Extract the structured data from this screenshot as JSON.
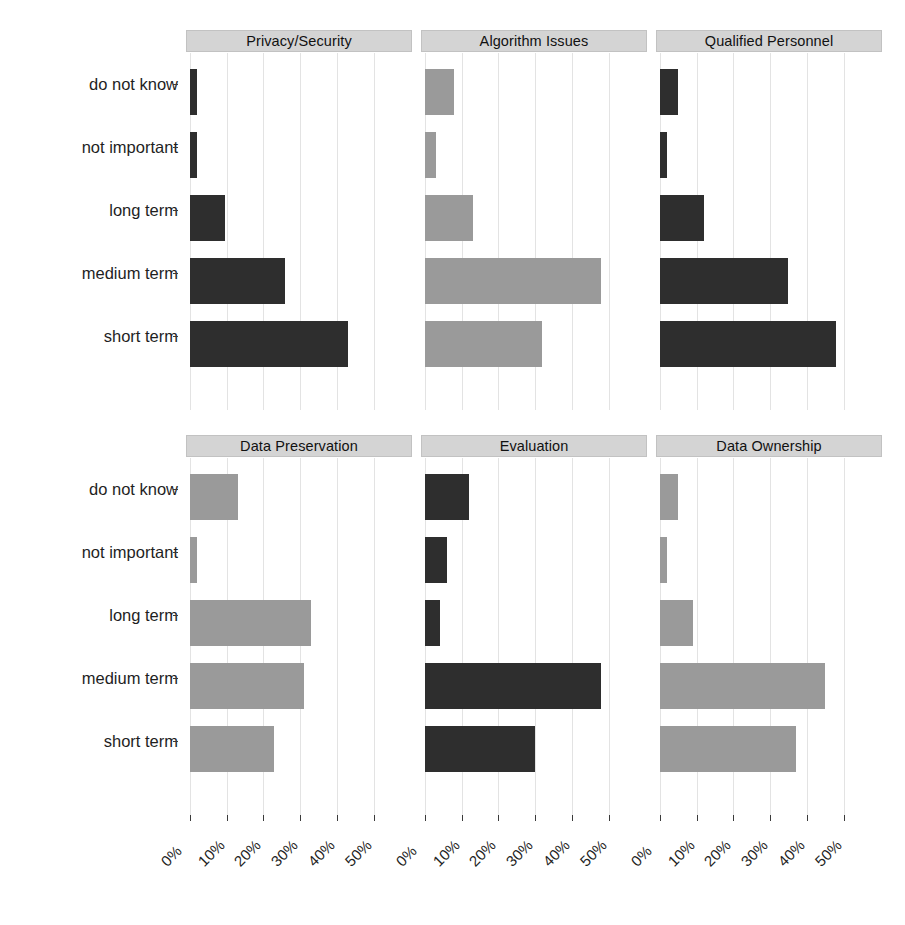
{
  "chart_data": {
    "type": "bar",
    "title": "Challenges by time horizon",
    "xlabel": "",
    "ylabel": "",
    "xlim": [
      0,
      56
    ],
    "grid": true,
    "legend": "none",
    "orientation": "horizontal",
    "categories": [
      "do not know",
      "not important",
      "long term",
      "medium term",
      "short term"
    ],
    "xticks": [
      "0%",
      "10%",
      "20%",
      "30%",
      "40%",
      "50%"
    ],
    "xtick_values": [
      0,
      10,
      20,
      30,
      40,
      50
    ],
    "facets": [
      {
        "label": "Privacy/Security",
        "color": "#2e2e2e",
        "tone": "dark",
        "values": [
          2,
          2,
          9.5,
          26,
          43
        ]
      },
      {
        "label": "Algorithm Issues",
        "color": "#9a9a9a",
        "tone": "light",
        "values": [
          8,
          3,
          13,
          48,
          32
        ]
      },
      {
        "label": "Qualified Personnel",
        "color": "#2e2e2e",
        "tone": "dark",
        "values": [
          5,
          2,
          12,
          35,
          48
        ]
      },
      {
        "label": "Data Preservation",
        "color": "#9a9a9a",
        "tone": "light",
        "values": [
          13,
          2,
          33,
          31,
          23
        ]
      },
      {
        "label": "Evaluation",
        "color": "#2e2e2e",
        "tone": "dark",
        "values": [
          12,
          6,
          4,
          48,
          30
        ]
      },
      {
        "label": "Data Ownership",
        "color": "#9a9a9a",
        "tone": "light",
        "values": [
          5,
          2,
          9,
          45,
          37
        ]
      }
    ]
  }
}
